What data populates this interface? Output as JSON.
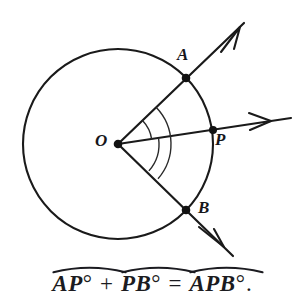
{
  "figure": {
    "background_color": "#ffffff",
    "stroke_color": "#1a1a1a"
  },
  "circle": {
    "center_label": "O",
    "center_x": 118,
    "center_y": 144,
    "radius": 95
  },
  "points": [
    {
      "id": "A",
      "label": "A",
      "x": 186,
      "y": 78,
      "angle_deg": -44,
      "marker": "filled-dot"
    },
    {
      "id": "P",
      "label": "P",
      "x": 213,
      "y": 130,
      "angle_deg": -8,
      "marker": "filled-dot"
    },
    {
      "id": "B",
      "label": "B",
      "x": 186,
      "y": 210,
      "angle_deg": 41,
      "marker": "filled-dot"
    },
    {
      "id": "O",
      "label": "O",
      "x": 118,
      "y": 144,
      "angle_deg": 0,
      "marker": "filled-dot"
    }
  ],
  "rays": [
    {
      "id": "ray-OA",
      "from": "O",
      "through": "A",
      "tip_x": 244,
      "tip_y": 23,
      "arrowhead": "open"
    },
    {
      "id": "ray-OP",
      "from": "O",
      "through": "P",
      "tip_x": 291,
      "tip_y": 118,
      "arrowhead": "open"
    },
    {
      "id": "ray-OB",
      "from": "O",
      "through": "B",
      "tip_x": 233,
      "tip_y": 256,
      "arrowhead": "open"
    }
  ],
  "angle_arcs": [
    {
      "id": "arc-AOP",
      "between": "A-P",
      "radius": 34,
      "start_deg": -44,
      "end_deg": -8
    },
    {
      "id": "arc-POB",
      "between": "P-B",
      "radius": 41,
      "start_deg": -8,
      "end_deg": 41
    },
    {
      "id": "arc-AOB",
      "between": "A-B",
      "radius": 53,
      "start_deg": -44,
      "end_deg": 41
    }
  ],
  "caption": {
    "terms": [
      {
        "id": "term-AP",
        "letters": "AP",
        "degree": "°",
        "arc": true
      },
      {
        "id": "term-PB",
        "letters": "PB",
        "degree": "°",
        "arc": true
      },
      {
        "id": "term-APB",
        "letters": "APB",
        "degree": "°",
        "arc": true
      }
    ],
    "plus": "+",
    "equals": "=",
    "period": ".",
    "full_text": "AP° + PB° = APB°."
  }
}
